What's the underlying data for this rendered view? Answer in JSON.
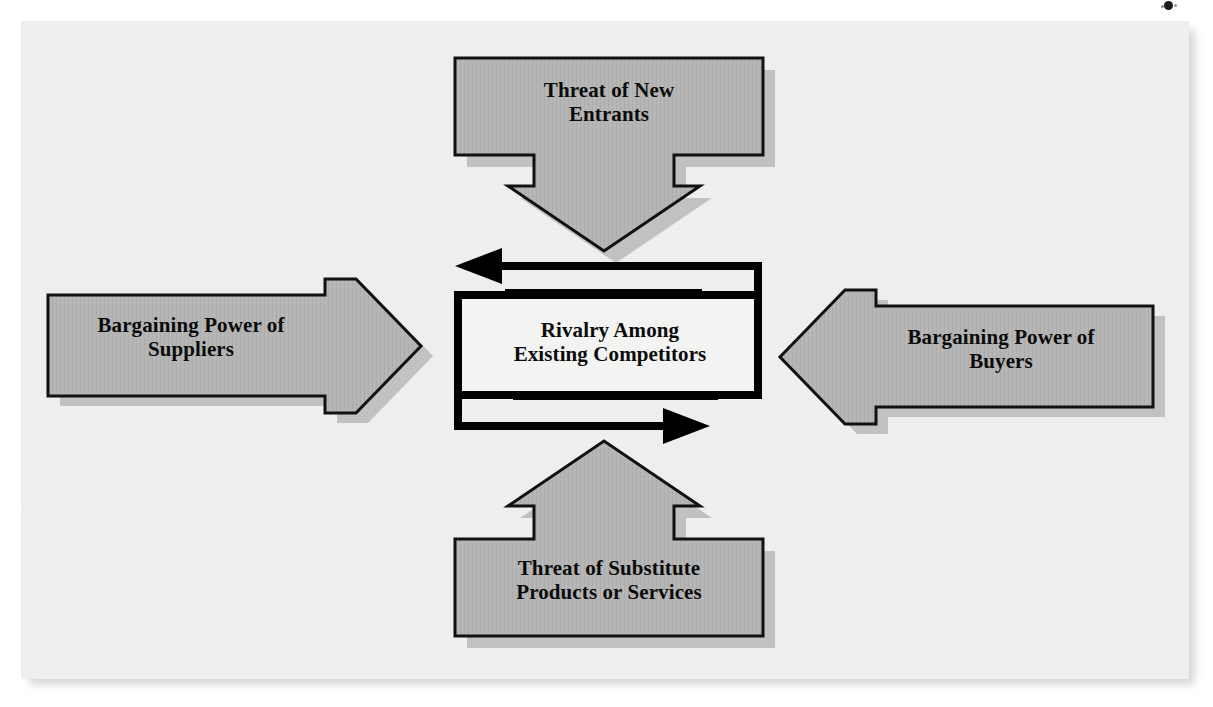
{
  "diagram": {
    "type": "five-forces-framework",
    "colors": {
      "page_background": "#f1f1f0",
      "box_fill": "#b3b3b3",
      "box_stroke": "#111111",
      "shadow": "#9a9a9a",
      "text": "#0b0b0b",
      "center_stroke": "#000000"
    },
    "nodes": [
      {
        "id": "threat-of-new-entrants",
        "label": "Threat of New\nEntrants",
        "position": "top",
        "shape": "arrow-box",
        "arrow_direction": "down",
        "points_to": "rivalry-among-existing-competitors"
      },
      {
        "id": "bargaining-power-of-suppliers",
        "label": "Bargaining Power of\nSuppliers",
        "position": "left",
        "shape": "arrow-box",
        "arrow_direction": "right",
        "points_to": "rivalry-among-existing-competitors"
      },
      {
        "id": "rivalry-among-existing-competitors",
        "label": "Rivalry Among\nExisting Competitors",
        "position": "center",
        "shape": "rectangle-with-circular-flow",
        "arrow_direction": "circular"
      },
      {
        "id": "bargaining-power-of-buyers",
        "label": "Bargaining Power of\nBuyers",
        "position": "right",
        "shape": "arrow-box",
        "arrow_direction": "left",
        "points_to": "rivalry-among-existing-competitors"
      },
      {
        "id": "threat-of-substitute-products-or-services",
        "label": "Threat of Substitute\nProducts or Services",
        "position": "bottom",
        "shape": "arrow-box",
        "arrow_direction": "up",
        "points_to": "rivalry-among-existing-competitors"
      }
    ],
    "flow_arrows": [
      {
        "id": "rivalry-flow-top",
        "direction": "left",
        "description": "upper circular flow arrow pointing left"
      },
      {
        "id": "rivalry-flow-bottom",
        "direction": "right",
        "description": "lower circular flow arrow pointing right"
      }
    ],
    "artifacts": [
      {
        "id": "scan-speck",
        "description": "small dark scanning speck near the top right edge"
      }
    ]
  }
}
